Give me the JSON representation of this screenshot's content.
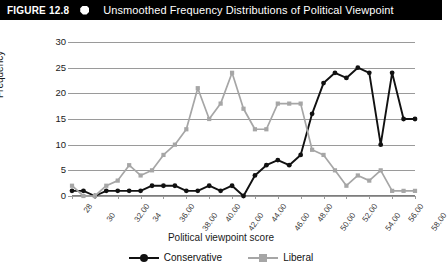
{
  "header": {
    "figure_label": "FIGURE 12.8",
    "bullet_icon": "octagon-bullet-icon",
    "title": "Unsmoothed Frequency Distributions of Political Viewpoint"
  },
  "chart_data": {
    "type": "line",
    "title": "Unsmoothed Frequency Distributions of Political Viewpoint",
    "xlabel": "Political viewpoint score",
    "ylabel": "Frequency",
    "xlim": [
      28,
      58
    ],
    "ylim": [
      0,
      30
    ],
    "yticks": [
      0,
      5,
      10,
      15,
      20,
      25,
      30
    ],
    "grid": true,
    "legend_position": "bottom-center",
    "x": [
      28,
      29,
      30,
      31,
      32,
      33,
      34,
      35,
      36,
      37,
      38,
      39,
      40,
      41,
      42,
      43,
      44,
      45,
      46,
      47,
      48,
      49,
      50,
      51,
      52,
      53,
      54,
      55,
      56,
      57,
      58
    ],
    "xtick_labels": [
      "28",
      "30",
      "32.00",
      "34",
      "36.00",
      "38.00",
      "40.00",
      "42.00",
      "44.00",
      "46.00",
      "48.00",
      "50.00",
      "52.00",
      "54.00",
      "56.00",
      "58.00"
    ],
    "xtick_values": [
      28,
      30,
      32,
      34,
      36,
      38,
      40,
      42,
      44,
      46,
      48,
      50,
      52,
      54,
      56,
      58
    ],
    "series": [
      {
        "name": "Conservative",
        "color": "#111111",
        "marker": "diamond",
        "values": [
          1,
          1,
          0,
          1,
          1,
          1,
          1,
          2,
          2,
          2,
          1,
          1,
          2,
          1,
          2,
          0,
          4,
          6,
          7,
          6,
          8,
          16,
          22,
          24,
          23,
          25,
          24,
          10,
          24,
          15,
          15
        ]
      },
      {
        "name": "Liberal",
        "color": "#a6a6a6",
        "marker": "square",
        "values": [
          2,
          0,
          0,
          2,
          3,
          6,
          4,
          5,
          8,
          10,
          13,
          21,
          15,
          18,
          24,
          17,
          13,
          13,
          18,
          18,
          18,
          9,
          8,
          5,
          2,
          4,
          3,
          5,
          1,
          1,
          1
        ]
      }
    ]
  },
  "chart_data_tail": {
    "note": "continuation of series beyond x=58 is not plotted"
  },
  "series_full": {
    "conservative": [
      1,
      1,
      0,
      1,
      1,
      1,
      1,
      2,
      2,
      2,
      1,
      1,
      2,
      1,
      2,
      0,
      4,
      6,
      7,
      6,
      8,
      16,
      22,
      24,
      23,
      25,
      24,
      10,
      24,
      15,
      15,
      10,
      8,
      5,
      2,
      5,
      4,
      2
    ],
    "liberal": [
      2,
      0,
      0,
      2,
      3,
      6,
      4,
      5,
      8,
      10,
      13,
      21,
      15,
      18,
      24,
      17,
      13,
      13,
      18,
      18,
      18,
      9,
      8,
      5,
      2,
      4,
      3,
      5,
      1,
      1,
      1,
      1,
      1,
      1,
      1,
      1,
      1,
      1
    ]
  },
  "legend": {
    "items": [
      {
        "label": "Conservative",
        "color": "#111111",
        "marker": "diamond"
      },
      {
        "label": "Liberal",
        "color": "#a6a6a6",
        "marker": "square"
      }
    ]
  }
}
